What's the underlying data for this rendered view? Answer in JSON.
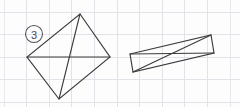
{
  "figure": {
    "canvas": {
      "width": 240,
      "height": 107,
      "background": "#fdfdfd"
    },
    "grid": {
      "label": "grid-paper background",
      "color": "#e2e2e8",
      "spacing_px": 22.6,
      "x_offset_px": 4,
      "y_offset_px": 12,
      "vertical_lines": [
        4,
        26.6,
        49.2,
        71.8,
        94.4,
        117,
        139.6,
        162.2,
        184.8,
        207.4,
        230
      ],
      "horizontal_lines": [
        12,
        34.6,
        57.2,
        79.8,
        102.4
      ]
    },
    "item_label": {
      "text": "3",
      "style": "circled-number",
      "center_x": 34,
      "center_y": 34,
      "radius": 8.5,
      "stroke_color": "#52525a"
    },
    "stroke_color": "#3b3b3b",
    "shapes": [
      {
        "name": "left-quadrilateral",
        "description": "kite-like quadrilateral with both diagonals drawn",
        "vertices": [
          {
            "name": "top",
            "x": 80,
            "y": 14
          },
          {
            "name": "right",
            "x": 110,
            "y": 57
          },
          {
            "name": "bottom",
            "x": 59,
            "y": 99
          },
          {
            "name": "left",
            "x": 27,
            "y": 57
          }
        ],
        "diagonals": [
          {
            "name": "horizontal-diagonal",
            "from": "left",
            "to": "right"
          },
          {
            "name": "vertical-diagonal",
            "from": "top",
            "to": "bottom"
          }
        ]
      },
      {
        "name": "right-parallelogram",
        "description": "elongated tilted parallelogram with both diagonals drawn",
        "vertices": [
          {
            "name": "top-left",
            "x": 130,
            "y": 54
          },
          {
            "name": "top-right",
            "x": 211,
            "y": 35
          },
          {
            "name": "bottom-right",
            "x": 214,
            "y": 53
          },
          {
            "name": "bottom-left",
            "x": 133,
            "y": 72
          }
        ],
        "diagonals": [
          {
            "name": "diagonal-a",
            "from": "top-left",
            "to": "bottom-right"
          },
          {
            "name": "diagonal-b",
            "from": "top-right",
            "to": "bottom-left"
          }
        ]
      }
    ]
  }
}
